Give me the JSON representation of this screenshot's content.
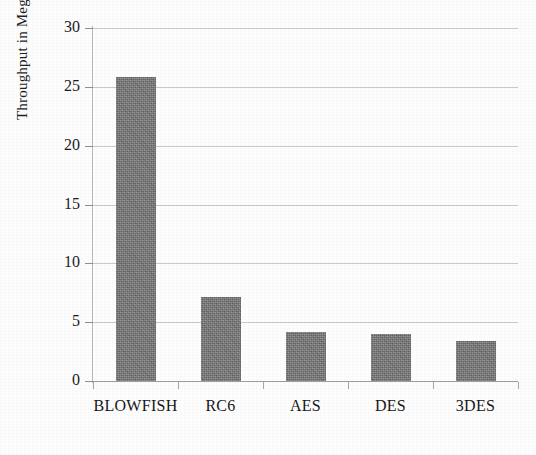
{
  "chart_data": {
    "type": "bar",
    "title": "",
    "xlabel": "",
    "ylabel": "Throughput in MegaBytes",
    "categories": [
      "BLOWFISH",
      "RC6",
      "AES",
      "DES",
      "3DES"
    ],
    "values": [
      25.8,
      7.1,
      4.2,
      4.0,
      3.4
    ],
    "series": [
      {
        "name": "Throughput",
        "values": [
          25.8,
          7.1,
          4.2,
          4.0,
          3.4
        ]
      }
    ],
    "ylim": [
      0,
      30
    ],
    "yticks": [
      0,
      5,
      10,
      15,
      20,
      25,
      30
    ],
    "ytick_labels": [
      "0",
      "5",
      "10",
      "15",
      "20",
      "25",
      "30"
    ],
    "grid": true,
    "grid_axis": "y",
    "legend": false,
    "legend_position": "none",
    "bar_color": "#757575",
    "gridline_color": "#c9c9c9",
    "axis_color": "#9d9d9d",
    "background_color": "#fdfdfd"
  },
  "figure": {
    "y_axis_title": "Throughput in MegaBytes"
  }
}
